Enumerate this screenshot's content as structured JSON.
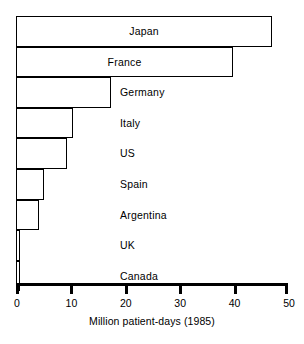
{
  "chart_data": {
    "type": "bar",
    "orientation": "horizontal",
    "title": "",
    "xlabel": "Million patient-days (1985)",
    "ylabel": "",
    "xlim": [
      0,
      50
    ],
    "xticks": [
      0,
      10,
      20,
      30,
      40,
      50
    ],
    "xtick_labels": [
      "0",
      "10",
      "20",
      "30",
      "40",
      "50"
    ],
    "grid": false,
    "legend": null,
    "categories": [
      "Japan",
      "France",
      "Germany",
      "Italy",
      "US",
      "Spain",
      "Argentina",
      "UK",
      "Canada"
    ],
    "values": [
      47.1,
      39.9,
      17.5,
      10.4,
      9.3,
      5.1,
      4.2,
      0.8,
      0.3
    ],
    "bars": [
      {
        "label": "Japan",
        "value": 47.1,
        "label_placement": "inside"
      },
      {
        "label": "France",
        "value": 39.9,
        "label_placement": "inside"
      },
      {
        "label": "Germany",
        "value": 17.5,
        "label_placement": "outside"
      },
      {
        "label": "Italy",
        "value": 10.4,
        "label_placement": "outside"
      },
      {
        "label": "US",
        "value": 9.3,
        "label_placement": "outside"
      },
      {
        "label": "Spain",
        "value": 5.1,
        "label_placement": "outside"
      },
      {
        "label": "Argentina",
        "value": 4.2,
        "label_placement": "outside"
      },
      {
        "label": "UK",
        "value": 0.8,
        "label_placement": "outside"
      },
      {
        "label": "Canada",
        "value": 0.3,
        "label_placement": "outside"
      }
    ],
    "colors": {
      "bar_fill": "#ffffff",
      "bar_stroke": "#000000",
      "axis": "#000000",
      "text": "#000000",
      "background": "#ffffff"
    }
  }
}
